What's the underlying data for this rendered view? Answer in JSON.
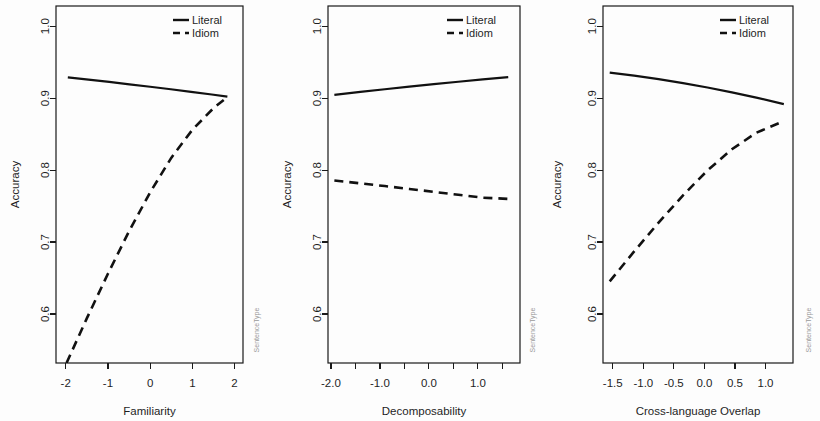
{
  "figure": {
    "background": "#fdfdfd",
    "line_color": "#111111",
    "text_color": "#1f1f1f",
    "strip_color": "#9a9a9a",
    "width": 820,
    "height": 421
  },
  "legend": {
    "entries": [
      {
        "label": "Literal",
        "style": "solid"
      },
      {
        "label": "Idiom",
        "style": "dashed"
      }
    ]
  },
  "chart_data": [
    {
      "type": "line",
      "title": "",
      "xlabel": "Familiarity",
      "ylabel": "Accuracy",
      "strip_label": "SentenceType",
      "xlim": [
        -2.23,
        2.2
      ],
      "ylim": [
        0.532,
        1.028
      ],
      "xticks": [
        -2,
        -1,
        0,
        1,
        2
      ],
      "xticklabels": [
        "-2",
        "-1",
        "0",
        "1",
        "2"
      ],
      "yticks": [
        0.6,
        0.7,
        0.8,
        0.9,
        1.0
      ],
      "yticklabels": [
        "0.6",
        "0.7",
        "0.8",
        "0.9",
        "1.0"
      ],
      "grid": false,
      "legend_position": "top-right",
      "series": [
        {
          "name": "Literal",
          "style": "solid",
          "x": [
            -1.95,
            -1.46,
            -0.97,
            -0.49,
            0.0,
            0.49,
            0.97,
            1.46,
            1.83
          ],
          "y": [
            0.9288,
            0.9257,
            0.9225,
            0.9192,
            0.9158,
            0.9123,
            0.9087,
            0.905,
            0.9021
          ]
        },
        {
          "name": "Idiom",
          "style": "dashed",
          "x": [
            -1.98,
            -1.5,
            -1.0,
            -0.5,
            0.0,
            0.5,
            1.0,
            1.5,
            1.83
          ],
          "y": [
            0.532,
            0.594,
            0.656,
            0.715,
            0.769,
            0.817,
            0.856,
            0.886,
            0.9015
          ]
        }
      ]
    },
    {
      "type": "line",
      "title": "",
      "xlabel": "Decomposability",
      "ylabel": "Accuracy",
      "strip_label": "SentenceType",
      "xlim": [
        -2.06,
        1.86
      ],
      "ylim": [
        0.532,
        1.028
      ],
      "xticks": [
        -2.0,
        -1.5,
        -1.0,
        -0.5,
        0.0,
        0.5,
        1.0,
        1.5
      ],
      "xticklabels": [
        "-2.0",
        "",
        "-1.0",
        "",
        "0.0",
        "",
        "1.0",
        ""
      ],
      "yticks": [
        0.6,
        0.7,
        0.8,
        0.9,
        1.0
      ],
      "yticklabels": [
        "0.6",
        "0.7",
        "0.8",
        "0.9",
        "1.0"
      ],
      "grid": false,
      "legend_position": "top-right",
      "series": [
        {
          "name": "Literal",
          "style": "solid",
          "x": [
            -1.93,
            -1.4,
            -0.9,
            -0.4,
            0.1,
            0.6,
            1.1,
            1.62
          ],
          "y": [
            0.9046,
            0.9086,
            0.9123,
            0.9159,
            0.9194,
            0.9228,
            0.926,
            0.9292
          ]
        },
        {
          "name": "Idiom",
          "style": "dashed",
          "x": [
            -1.93,
            -1.4,
            -0.9,
            -0.4,
            0.1,
            0.6,
            1.1,
            1.62
          ],
          "y": [
            0.7855,
            0.7816,
            0.7778,
            0.7738,
            0.7698,
            0.7657,
            0.7617,
            0.76
          ]
        }
      ]
    },
    {
      "type": "line",
      "title": "",
      "xlabel": "Cross-language Overlap",
      "ylabel": "Accuracy",
      "strip_label": "SentenceType",
      "xlim": [
        -1.66,
        1.45
      ],
      "ylim": [
        0.532,
        1.028
      ],
      "xticks": [
        -1.5,
        -1.0,
        -0.5,
        0.0,
        0.5,
        1.0
      ],
      "xticklabels": [
        "-1.5",
        "-1.0",
        "-0.5",
        "0.0",
        "0.5",
        "1.0"
      ],
      "yticks": [
        0.6,
        0.7,
        0.8,
        0.9,
        1.0
      ],
      "yticklabels": [
        "0.6",
        "0.7",
        "0.8",
        "0.9",
        "1.0"
      ],
      "grid": false,
      "legend_position": "top-right",
      "series": [
        {
          "name": "Literal",
          "style": "solid",
          "x": [
            -1.55,
            -1.15,
            -0.75,
            -0.35,
            0.05,
            0.45,
            0.85,
            1.3
          ],
          "y": [
            0.9355,
            0.9312,
            0.9263,
            0.9208,
            0.9148,
            0.9081,
            0.9007,
            0.8917
          ]
        },
        {
          "name": "Idiom",
          "style": "dashed",
          "x": [
            -1.55,
            -1.15,
            -0.75,
            -0.35,
            0.05,
            0.45,
            0.85,
            1.3
          ],
          "y": [
            0.6455,
            0.687,
            0.727,
            0.765,
            0.7995,
            0.829,
            0.852,
            0.868
          ]
        }
      ]
    }
  ]
}
